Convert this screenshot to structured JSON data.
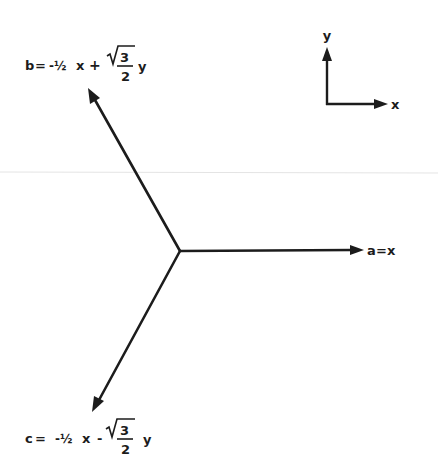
{
  "diagram": {
    "title": "",
    "colors": {
      "ink": "#1c1c1c",
      "background": "#ffffff",
      "scan_line": "#e4e4e4"
    },
    "reference_axes": {
      "x_label": "x",
      "y_label": "y"
    },
    "vectors": [
      {
        "id": "a",
        "label": "a = x",
        "lhs": "a",
        "eq": "=",
        "rhs": "x"
      },
      {
        "id": "b",
        "label": "b = -½ x + √3/2 y",
        "lhs": "b",
        "eq": "=",
        "coef1": "-½",
        "var1": "x",
        "op": "+",
        "sqrt_num": "3",
        "den": "2",
        "var2": "y"
      },
      {
        "id": "c",
        "label": "c = -½ x - √3/2 y",
        "lhs": "c",
        "eq": "=",
        "coef1": "-½",
        "var1": "x",
        "op": "-",
        "sqrt_num": "3",
        "den": "2",
        "var2": "y"
      }
    ]
  }
}
